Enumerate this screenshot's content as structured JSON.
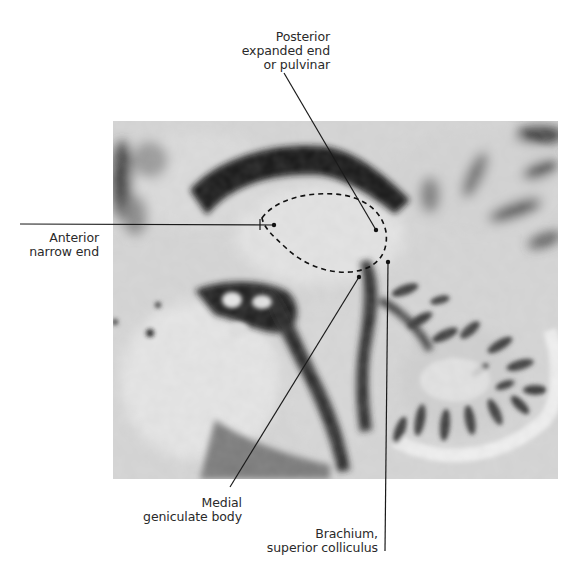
{
  "figure": {
    "outline_style": "dashed",
    "colors": {
      "background": "#ffffff",
      "line": "#1a1a1a",
      "text": "#2a2a2a"
    }
  },
  "labels": {
    "pulvinar": {
      "lines": [
        "Posterior",
        "expanded end",
        "or pulvinar"
      ],
      "pointer": {
        "from": [
          284,
          73
        ],
        "to": [
          376,
          230
        ]
      }
    },
    "anterior": {
      "lines": [
        "Anterior",
        "narrow end"
      ],
      "pointer": {
        "from": [
          20,
          224
        ],
        "to": [
          273,
          225
        ]
      }
    },
    "mgb": {
      "lines": [
        "Medial",
        "geniculate body"
      ],
      "pointer": {
        "from": [
          230,
          487
        ],
        "to": [
          359,
          277
        ]
      }
    },
    "brachium": {
      "lines": [
        "Brachium,",
        "superior colliculus"
      ],
      "pointer": {
        "from": [
          385,
          551
        ],
        "to": [
          388,
          262
        ]
      }
    }
  }
}
